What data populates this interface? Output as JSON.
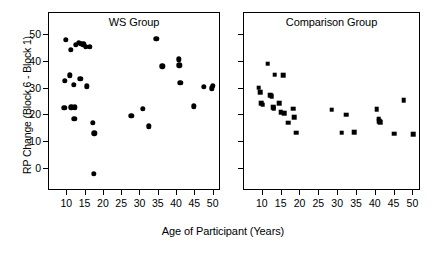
{
  "figure": {
    "xlabel": "Age of Participant (Years)",
    "ylabel": "RP Change (Block 6 - Block 1)"
  },
  "chart_data": {
    "type": "scatter",
    "title": "",
    "xlabel": "Age of Participant (Years)",
    "ylabel": "RP Change (Block 6 - Block 1)",
    "xlim": [
      5,
      52
    ],
    "ylim": [
      -8,
      58
    ],
    "xticks": [
      10,
      15,
      20,
      25,
      30,
      35,
      40,
      45,
      50
    ],
    "yticks": [
      0,
      10,
      20,
      30,
      40,
      50
    ],
    "grid": false,
    "legend": "none",
    "panels": [
      {
        "name": "ws-group",
        "title": "WS Group",
        "marker": "circle",
        "color": "#000000",
        "x": [
          9.8,
          11.2,
          12.6,
          13.5,
          14.0,
          14.6,
          15.3,
          16.4,
          9.6,
          10.9,
          12.0,
          13.8,
          15.6,
          17.6,
          9.5,
          11.4,
          12.2,
          12.4,
          17.3,
          17.5,
          27.8,
          30.9,
          32.5,
          34.6,
          36.2,
          40.8,
          40.9,
          41.2,
          44.9,
          47.6,
          49.8,
          50.1
        ],
        "y": [
          47.6,
          43.9,
          45.8,
          46.6,
          46.3,
          46.0,
          45.2,
          45.2,
          32.5,
          34.5,
          31.1,
          33.2,
          30.4,
          13.0,
          22.5,
          22.7,
          18.5,
          22.7,
          17.0,
          -2.0,
          19.5,
          22.1,
          15.6,
          48.0,
          37.9,
          40.5,
          38.3,
          31.8,
          23.1,
          30.2,
          29.7,
          30.6
        ]
      },
      {
        "name": "comparison-group",
        "title": "Comparison Group",
        "marker": "square",
        "color": "#000000",
        "x": [
          9.2,
          9.5,
          9.8,
          10.2,
          11.6,
          12.3,
          12.6,
          13.0,
          13.2,
          13.4,
          14.6,
          15.0,
          15.6,
          16.0,
          17.0,
          18.3,
          18.6,
          19.1,
          28.6,
          31.2,
          32.4,
          34.6,
          40.5,
          41.0,
          41.2,
          41.4,
          45.1,
          47.7,
          50.2
        ],
        "y": [
          29.9,
          28.3,
          24.2,
          23.6,
          38.8,
          27.2,
          26.8,
          22.6,
          22.3,
          34.8,
          24.1,
          20.9,
          34.6,
          20.5,
          17.0,
          22.1,
          19.0,
          13.3,
          21.8,
          13.2,
          19.9,
          13.5,
          21.9,
          18.4,
          17.6,
          17.1,
          12.9,
          25.3,
          12.6
        ]
      }
    ]
  }
}
